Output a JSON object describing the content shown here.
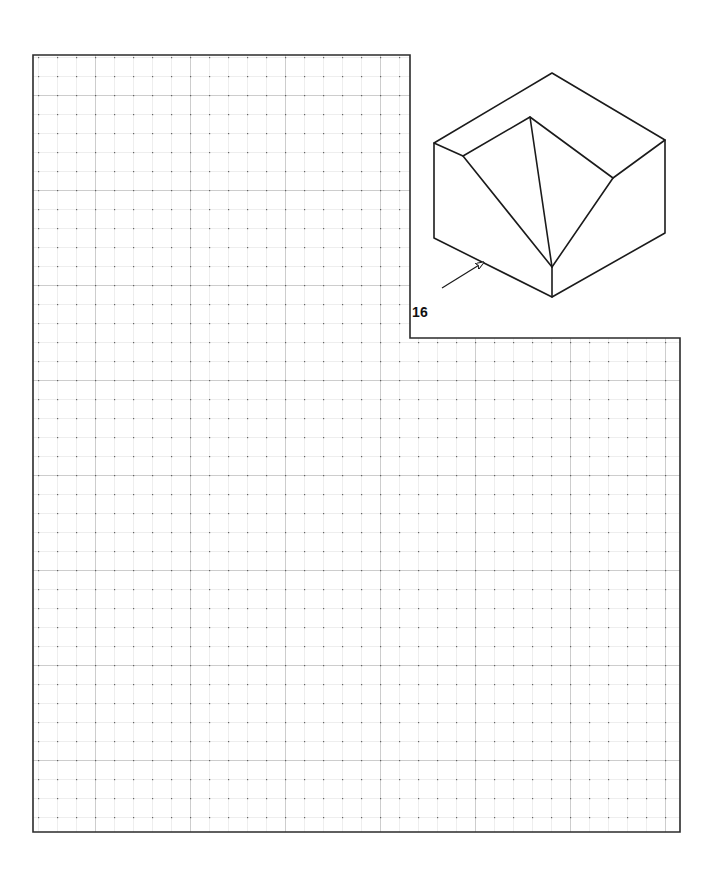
{
  "page": {
    "background_color": "#ffffff",
    "width": 719,
    "height": 875,
    "kind": "engineering-graphics-worksheet"
  },
  "problem": {
    "number_label": "16",
    "number_x": 412,
    "number_y": 311,
    "ink_color": "#1a1a1a"
  },
  "grid": {
    "cell_size": 19.0,
    "minor_color": "#c9c9c9",
    "major_color": "#8d8d8d",
    "node_color": "#555555",
    "border_color": "#2b2b2b",
    "border_width": 1.6,
    "upper_region": {
      "x": 33,
      "y": 55,
      "width": 377,
      "height": 283
    },
    "lower_region": {
      "x": 33,
      "y": 338,
      "width": 647,
      "height": 494
    },
    "outline_points": "33,55 410,55 410,338 680,338 680,832 33,832"
  },
  "pictorial": {
    "title": "isometric-solid-with-v-groove",
    "stroke_color": "#1b1b1b",
    "stroke_width": 1.6,
    "vertices": {
      "top_apex": [
        552,
        73
      ],
      "top_left": [
        434,
        143
      ],
      "top_right": [
        665,
        140
      ],
      "ridge_top": [
        530,
        117
      ],
      "ledge_left": [
        463,
        156
      ],
      "ledge_right": [
        613,
        178
      ],
      "bottom_apex": [
        552,
        267
      ],
      "front_bottom": [
        552,
        297
      ],
      "left_bottom": [
        434,
        238
      ],
      "right_bottom": [
        665,
        233
      ]
    },
    "edges": [
      "top_apex-top_left",
      "top_apex-top_right",
      "top_left-ledge_left",
      "top_right-ledge_right",
      "ledge_left-ridge_top",
      "ledge_right-ridge_top",
      "ridge_top-bottom_apex",
      "ledge_left-bottom_apex",
      "ledge_right-bottom_apex",
      "top_left-left_bottom",
      "top_right-right_bottom",
      "left_bottom-front_bottom",
      "right_bottom-front_bottom",
      "bottom_apex-front_bottom"
    ]
  },
  "view_arrow": {
    "name": "view-direction-arrow",
    "tail": [
      442,
      288
    ],
    "head": [
      484,
      262
    ],
    "stroke_color": "#1b1b1b",
    "stroke_width": 1.2
  }
}
